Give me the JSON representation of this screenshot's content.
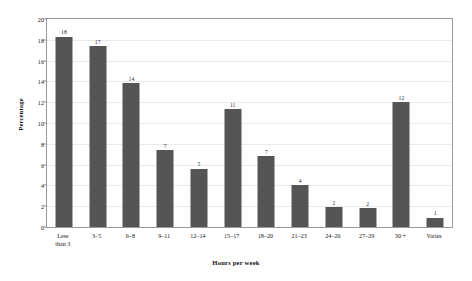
{
  "chart_data": {
    "type": "bar",
    "title": "",
    "xlabel": "Hours per week",
    "ylabel": "Percentage",
    "categories": [
      "Less\nthan 3",
      "3–5",
      "6–8",
      "9–11",
      "12–14",
      "15–17",
      "18–20",
      "21–23",
      "24–26",
      "27–29",
      "30 +",
      "Varies"
    ],
    "values": [
      18.3,
      17.4,
      13.8,
      7.4,
      5.6,
      11.3,
      6.8,
      4.0,
      1.9,
      1.8,
      12.0,
      0.9
    ],
    "data_labels": [
      "18",
      "17",
      "14",
      "7",
      "5",
      "11",
      "7",
      "4",
      "2",
      "2",
      "12",
      "1"
    ],
    "ylim": [
      0,
      20
    ],
    "yticks": [
      "0",
      "2",
      "4",
      "6",
      "8",
      "10",
      "12",
      "14",
      "16",
      "18",
      "20"
    ],
    "ytick_values": [
      0,
      2,
      4,
      6,
      8,
      10,
      12,
      14,
      16,
      18,
      20
    ],
    "grid": true,
    "legend": false,
    "bar_color": "#555555",
    "grid_color": "#e9e9e9",
    "axis_color": "#9a9a9a",
    "background": "#ffffff"
  }
}
